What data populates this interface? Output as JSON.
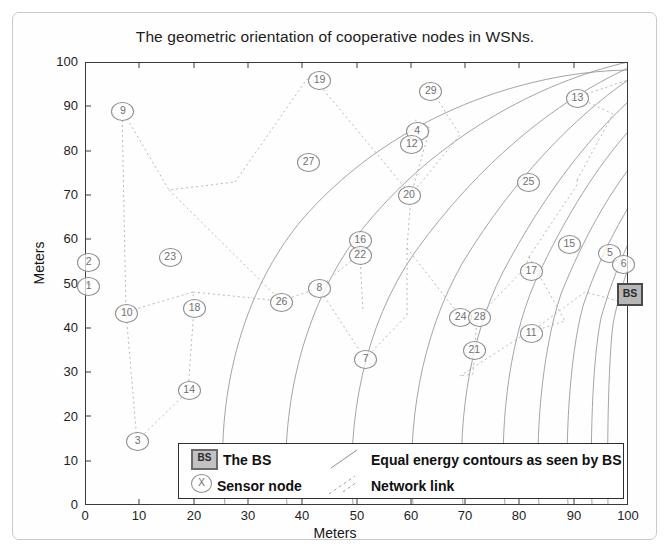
{
  "figure": {
    "title": "The geometric orientation of cooperative nodes in WSNs.",
    "xlabel": "Meters",
    "ylabel": "Meters"
  },
  "legend": {
    "bs_marker": "BS",
    "bs_label": "The BS",
    "sensor_marker": "X",
    "sensor_label": "Sensor node",
    "contours_label": "Equal energy contours as seen by BS",
    "link_label": "Network link"
  },
  "bs_node": {
    "label": "BS",
    "x": 100,
    "y": 48
  },
  "chart_data": {
    "type": "scatter",
    "title": "The geometric orientation of cooperative nodes in WSNs.",
    "xlabel": "Meters",
    "ylabel": "Meters",
    "xlim": [
      0,
      100
    ],
    "ylim": [
      0,
      100
    ],
    "xticks": [
      0,
      10,
      20,
      30,
      40,
      50,
      60,
      70,
      80,
      90,
      100
    ],
    "yticks": [
      0,
      10,
      20,
      30,
      40,
      50,
      60,
      70,
      80,
      90,
      100
    ],
    "grid": false,
    "legend_position": "bottom-center",
    "series": [
      {
        "name": "Sensor node",
        "points": [
          {
            "label": "1",
            "x": 0.5,
            "y": 49.5
          },
          {
            "label": "2",
            "x": 0.5,
            "y": 55.0
          },
          {
            "label": "3",
            "x": 9.5,
            "y": 14.5
          },
          {
            "label": "4",
            "x": 61.0,
            "y": 84.5
          },
          {
            "label": "5",
            "x": 96.5,
            "y": 57.0
          },
          {
            "label": "6",
            "x": 99.0,
            "y": 54.5
          },
          {
            "label": "7",
            "x": 51.5,
            "y": 33.0
          },
          {
            "label": "8",
            "x": 43.0,
            "y": 49.0
          },
          {
            "label": "9",
            "x": 6.8,
            "y": 89.0
          },
          {
            "label": "10",
            "x": 7.5,
            "y": 43.5
          },
          {
            "label": "11",
            "x": 82.0,
            "y": 39.0
          },
          {
            "label": "12",
            "x": 60.0,
            "y": 81.5
          },
          {
            "label": "13",
            "x": 90.5,
            "y": 92.0
          },
          {
            "label": "14",
            "x": 19.0,
            "y": 26.0
          },
          {
            "label": "15",
            "x": 89.0,
            "y": 59.0
          },
          {
            "label": "16",
            "x": 50.5,
            "y": 60.0
          },
          {
            "label": "17",
            "x": 82.0,
            "y": 53.0
          },
          {
            "label": "18",
            "x": 20.0,
            "y": 44.5
          },
          {
            "label": "19",
            "x": 43.0,
            "y": 96.0
          },
          {
            "label": "20",
            "x": 59.5,
            "y": 70.0
          },
          {
            "label": "21",
            "x": 71.5,
            "y": 35.0
          },
          {
            "label": "22",
            "x": 50.5,
            "y": 56.5
          },
          {
            "label": "23",
            "x": 15.5,
            "y": 56.0
          },
          {
            "label": "24",
            "x": 69.0,
            "y": 42.5
          },
          {
            "label": "25",
            "x": 81.5,
            "y": 73.0
          },
          {
            "label": "26",
            "x": 36.0,
            "y": 46.0
          },
          {
            "label": "27",
            "x": 41.0,
            "y": 77.5
          },
          {
            "label": "28",
            "x": 72.5,
            "y": 42.5
          },
          {
            "label": "29",
            "x": 63.5,
            "y": 93.5
          }
        ]
      }
    ],
    "base_station": {
      "label": "BS",
      "x": 100,
      "y": 48
    },
    "annotations": [
      "Equal energy contours as seen by BS",
      "Network link"
    ]
  }
}
